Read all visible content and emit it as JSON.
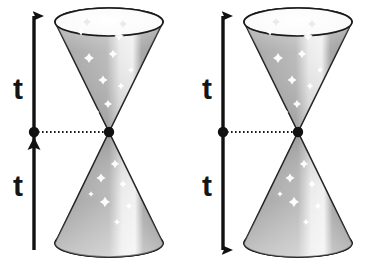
{
  "figure": {
    "width": 369,
    "height": 265,
    "background_color": "#ffffff"
  },
  "colors": {
    "outline": "#1a1a1a",
    "axis": "#111111",
    "label_text": "#151515",
    "cone_dark": "#8d8d8d",
    "cone_mid": "#a8a8a8",
    "cone_light": "#d8d8d8",
    "cone_highlight": "#efefef",
    "ellipse_top_fill": "#fbfbfb",
    "ellipse_bottom_fill": "#fdfdfd",
    "star": "#ffffff",
    "dotted_line": "#1a1a1a"
  },
  "panels": [
    {
      "id": "left-panel",
      "name": "light-cone-left",
      "axis": {
        "name": "time-axis-left",
        "x": 34,
        "top_y": 16,
        "bottom_y": 250,
        "arrow_top": "up",
        "arrow_bottom": "none",
        "arrow_mid": "up",
        "has_center_dot": true,
        "center_y": 132
      },
      "labels": [
        {
          "name": "upper-time-label",
          "text": "t",
          "x": 18,
          "y": 99
        },
        {
          "name": "lower-time-label",
          "text": "t",
          "x": 18,
          "y": 196
        }
      ],
      "cones": {
        "apex_x": 109,
        "apex_y": 132,
        "top": {
          "name": "future-light-cone",
          "rim_cy": 22,
          "rim_rx": 54,
          "rim_ry": 14
        },
        "bottom": {
          "name": "past-light-cone",
          "rim_cy": 243,
          "rim_rx": 54,
          "rim_ry": 14
        }
      },
      "dotted_connector": {
        "name": "event-connector-line",
        "x1": 34,
        "x2": 109,
        "y": 132
      }
    },
    {
      "id": "right-panel",
      "name": "light-cone-right",
      "axis": {
        "name": "time-axis-right",
        "x": 223,
        "top_y": 16,
        "bottom_y": 250,
        "arrow_top": "up",
        "arrow_bottom": "down",
        "arrow_mid": "none",
        "has_center_dot": true,
        "center_y": 132
      },
      "labels": [
        {
          "name": "upper-time-label",
          "text": "t",
          "x": 207,
          "y": 99
        },
        {
          "name": "lower-time-label",
          "text": "t",
          "x": 207,
          "y": 196
        }
      ],
      "cones": {
        "apex_x": 298,
        "apex_y": 132,
        "top": {
          "name": "future-light-cone",
          "rim_cy": 22,
          "rim_rx": 54,
          "rim_ry": 14
        },
        "bottom": {
          "name": "past-light-cone",
          "rim_cy": 243,
          "rim_rx": 54,
          "rim_ry": 14
        }
      },
      "dotted_connector": {
        "name": "event-connector-line",
        "x1": 223,
        "x2": 298,
        "y": 132
      }
    }
  ],
  "stars": {
    "top_cone_offsets": [
      {
        "dx": -20,
        "dy": -74,
        "r": 5.0
      },
      {
        "dx": 4,
        "dy": -78,
        "r": 4.2
      },
      {
        "dx": -28,
        "dy": -100,
        "r": 3.6
      },
      {
        "dx": 10,
        "dy": -96,
        "r": 4.8
      },
      {
        "dx": -6,
        "dy": -52,
        "r": 4.6
      },
      {
        "dx": 12,
        "dy": -46,
        "r": 3.4
      },
      {
        "dx": -1,
        "dy": -28,
        "r": 4.0
      },
      {
        "dx": 22,
        "dy": -62,
        "r": 3.0
      },
      {
        "dx": -12,
        "dy": -20,
        "r": 2.6
      }
    ],
    "bottom_cone_offsets": [
      {
        "dx": 6,
        "dy": 32,
        "r": 4.2
      },
      {
        "dx": -8,
        "dy": 46,
        "r": 4.6
      },
      {
        "dx": 14,
        "dy": 52,
        "r": 3.8
      },
      {
        "dx": -4,
        "dy": 70,
        "r": 5.2
      },
      {
        "dx": 20,
        "dy": 74,
        "r": 3.2
      },
      {
        "dx": -18,
        "dy": 62,
        "r": 2.8
      },
      {
        "dx": 8,
        "dy": 90,
        "r": 3.0
      }
    ],
    "rim_faint_offsets": [
      {
        "dx": -22,
        "dy": 0,
        "r": 4.0
      },
      {
        "dx": 14,
        "dy": 2,
        "r": 4.0
      }
    ]
  }
}
